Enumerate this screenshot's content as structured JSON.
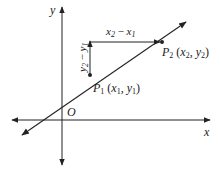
{
  "diagram": {
    "axes": {
      "x_label": "x",
      "y_label": "y",
      "origin_label": "O"
    },
    "points": [
      {
        "id": "P1",
        "name": "P",
        "sub": "1",
        "coords_label": "(x1, y1)",
        "x_sym": "x",
        "x_sub": "1",
        "y_sym": "y",
        "y_sub": "1"
      },
      {
        "id": "P2",
        "name": "P",
        "sub": "2",
        "coords_label": "(x2, y2)",
        "x_sym": "x",
        "x_sub": "2",
        "y_sym": "y",
        "y_sub": "2"
      }
    ],
    "rise_label": "y2 − y1",
    "run_label": "x2 − x1",
    "colors": {
      "stroke": "#222222",
      "background": "#ffffff"
    }
  }
}
